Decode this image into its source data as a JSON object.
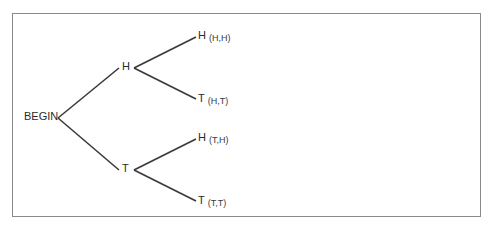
{
  "diagram": {
    "type": "tree",
    "title": "",
    "root": {
      "label": "BEGIN"
    },
    "level1": [
      {
        "label": "H"
      },
      {
        "label": "T"
      }
    ],
    "leaves": [
      {
        "label": "H",
        "outcome": "(H,H)"
      },
      {
        "label": "T",
        "outcome": "(H,T)"
      },
      {
        "label": "H",
        "outcome": "(T,H)"
      },
      {
        "label": "T",
        "outcome": "(T,T)"
      }
    ],
    "colors": {
      "line": "#3a3a3a",
      "frame": "#8a8a8a",
      "text": "#2a2a2a"
    }
  }
}
